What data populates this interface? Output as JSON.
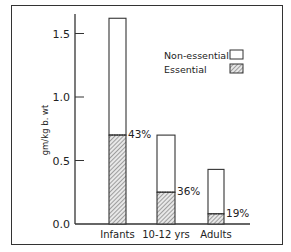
{
  "chart_data": {
    "type": "bar",
    "stacked": true,
    "title": "",
    "xlabel": "",
    "ylabel": "gm/kg b. wt",
    "ylim": [
      0,
      1.65
    ],
    "yticks": [
      0.0,
      0.5,
      1.0,
      1.5
    ],
    "ytick_labels": [
      "0.0",
      "0.5",
      "1.0",
      "1.5"
    ],
    "grid": false,
    "legend_position": "upper right",
    "categories": [
      "Infants",
      "10-12 yrs",
      "Adults"
    ],
    "series": [
      {
        "name": "Essential",
        "pattern": "hatched",
        "values": [
          0.7,
          0.25,
          0.08
        ]
      },
      {
        "name": "Non-essential",
        "pattern": "open",
        "values": [
          0.92,
          0.45,
          0.35
        ]
      }
    ],
    "totals": [
      1.62,
      0.7,
      0.43
    ],
    "annotations": [
      "43%",
      "36%",
      "19%"
    ]
  },
  "legend": {
    "items": [
      {
        "label": "Non-essential",
        "pattern": "open"
      },
      {
        "label": "Essential",
        "pattern": "hatched"
      }
    ]
  }
}
